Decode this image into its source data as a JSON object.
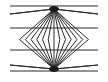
{
  "figure": {
    "name": "Wundt-style optical illusion",
    "line_color": "#2a2a2a",
    "background_color": "#ffffff",
    "ray_count_per_fan": 17
  }
}
